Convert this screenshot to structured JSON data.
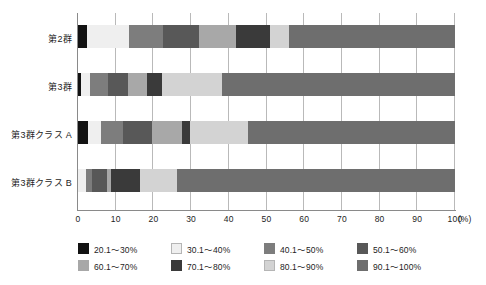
{
  "chart_data": {
    "type": "bar",
    "orientation": "horizontal",
    "stacked": true,
    "normalized_percent": true,
    "title": "",
    "xlabel": "(%)",
    "ylabel": "",
    "xlim": [
      0,
      100
    ],
    "xticks": [
      "0",
      "10",
      "20",
      "30",
      "40",
      "50",
      "60",
      "70",
      "80",
      "90",
      "100"
    ],
    "x_axis_unit": "(%)",
    "grid": "vertical",
    "legend_position": "bottom",
    "categories": [
      "第2群",
      "第3群",
      "第3群クラス A",
      "第3群クラス B"
    ],
    "series": [
      {
        "name": "20.1～30%",
        "color": "#121212",
        "values": [
          2.5,
          0.8,
          2.6,
          0.0
        ]
      },
      {
        "name": "30.1～40%",
        "color": "#efefef",
        "values": [
          11.0,
          2.4,
          3.4,
          2.2
        ]
      },
      {
        "name": "40.1～50%",
        "color": "#7d7d7d",
        "values": [
          9.0,
          4.8,
          6.0,
          1.4
        ]
      },
      {
        "name": "50.1～60%",
        "color": "#585858",
        "values": [
          9.5,
          5.2,
          7.6,
          4.0
        ]
      },
      {
        "name": "60.1～70%",
        "color": "#a8a8a8",
        "values": [
          10.0,
          5.0,
          8.0,
          1.2
        ]
      },
      {
        "name": "70.1～80%",
        "color": "#3a3a3a",
        "values": [
          9.0,
          4.0,
          2.2,
          7.6
        ]
      },
      {
        "name": "80.1～90%",
        "color": "#d3d3d3",
        "values": [
          5.0,
          16.0,
          15.4,
          9.8
        ]
      },
      {
        "name": "90.1～100%",
        "color": "#6e6e6e",
        "values": [
          44.0,
          61.8,
          54.8,
          73.8
        ]
      }
    ]
  },
  "legend": {
    "items": [
      {
        "label": "20.1～30%",
        "color": "#121212"
      },
      {
        "label": "30.1～40%",
        "color": "#efefef"
      },
      {
        "label": "40.1～50%",
        "color": "#7d7d7d"
      },
      {
        "label": "50.1～60%",
        "color": "#585858"
      },
      {
        "label": "60.1～70%",
        "color": "#a8a8a8"
      },
      {
        "label": "70.1～80%",
        "color": "#3a3a3a"
      },
      {
        "label": "80.1～90%",
        "color": "#d3d3d3"
      },
      {
        "label": "90.1～100%",
        "color": "#6e6e6e"
      }
    ]
  },
  "axis": {
    "y_categories": [
      "第2群",
      "第3群",
      "第3群クラス A",
      "第3群クラス B"
    ],
    "x_ticks": [
      "0",
      "10",
      "20",
      "30",
      "40",
      "50",
      "60",
      "70",
      "80",
      "90",
      "100"
    ],
    "x_unit": "(%)"
  },
  "colors": {
    "axis": "#8a8a8a",
    "grid": "#b9b9b9",
    "text": "#1d1d1d",
    "background": "#ffffff"
  }
}
